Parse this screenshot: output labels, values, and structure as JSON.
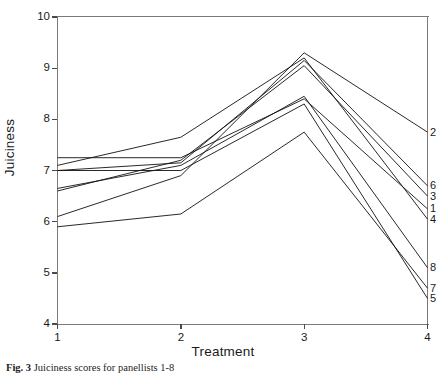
{
  "figure": {
    "caption_number": "Fig. 3",
    "caption_text": "Juiciness scores for panellists 1-8"
  },
  "axes": {
    "xlabel": "Treatment",
    "ylabel": "Juiciness",
    "xticks": [
      "1",
      "2",
      "3",
      "4"
    ],
    "yticks": [
      "10",
      "9",
      "8",
      "7",
      "6",
      "5",
      "4"
    ]
  },
  "chart_data": {
    "type": "line",
    "title": "",
    "xlabel": "Treatment",
    "ylabel": "Juiciness",
    "x": [
      1,
      2,
      3,
      4
    ],
    "xlim": [
      1,
      4
    ],
    "ylim": [
      4,
      10
    ],
    "grid": false,
    "legend": "right-edge-endpoint-labels",
    "series": [
      {
        "name": "1",
        "label": "1",
        "values": [
          7.25,
          7.25,
          8.4,
          6.25
        ]
      },
      {
        "name": "2",
        "label": "2",
        "values": [
          6.1,
          6.9,
          9.3,
          7.75
        ]
      },
      {
        "name": "3",
        "label": "3",
        "values": [
          6.6,
          7.2,
          9.05,
          6.5
        ]
      },
      {
        "name": "4",
        "label": "4",
        "values": [
          7.1,
          7.65,
          9.2,
          6.05
        ]
      },
      {
        "name": "5",
        "label": "5",
        "values": [
          7.0,
          7.0,
          8.3,
          4.5
        ]
      },
      {
        "name": "6",
        "label": "6",
        "values": [
          7.0,
          7.15,
          9.15,
          6.7
        ]
      },
      {
        "name": "7",
        "label": "7",
        "values": [
          5.9,
          6.15,
          7.75,
          4.7
        ]
      },
      {
        "name": "8",
        "label": "8",
        "values": [
          6.65,
          7.1,
          8.45,
          5.1
        ]
      }
    ],
    "line_color": "#111111"
  }
}
